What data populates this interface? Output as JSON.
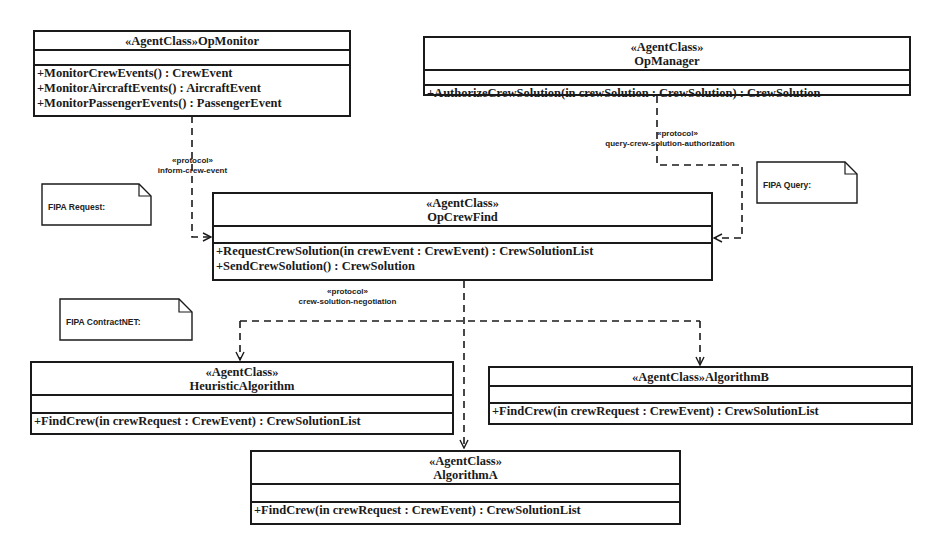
{
  "diagram": {
    "type": "UML agent class diagram",
    "classes": {
      "op_monitor": {
        "stereotype": "«AgentClass»",
        "name": "OpMonitor",
        "name_line": "«AgentClass»OpMonitor",
        "operations": [
          "+MonitorCrewEvents() : CrewEvent",
          "+MonitorAircraftEvents() : AircraftEvent",
          "+MonitorPassengerEvents() : PassengerEvent"
        ]
      },
      "op_manager": {
        "stereotype": "«AgentClass»",
        "name": "OpManager",
        "operations": [
          "+AuthorizeCrewSolution(in crewSolution : CrewSolution) : CrewSolution"
        ]
      },
      "op_crew_find": {
        "stereotype": "«AgentClass»",
        "name": "OpCrewFind",
        "operations": [
          "+RequestCrewSolution(in crewEvent : CrewEvent) : CrewSolutionList",
          "+SendCrewSolution() : CrewSolution"
        ]
      },
      "heuristic_algorithm": {
        "stereotype": "«AgentClass»",
        "name": "HeuristicAlgorithm",
        "operations": [
          "+FindCrew(in crewRequest : CrewEvent) : CrewSolutionList"
        ]
      },
      "algorithm_b": {
        "stereotype": "«AgentClass»",
        "name": "AlgorithmB",
        "name_line": "«AgentClass»AlgorithmB",
        "operations": [
          "+FindCrew(in crewRequest : CrewEvent) : CrewSolutionList"
        ]
      },
      "algorithm_a": {
        "stereotype": "«AgentClass»",
        "name": "AlgorithmA",
        "operations": [
          "+FindCrew(in crewRequest : CrewEvent) : CrewSolutionList"
        ]
      }
    },
    "protocols": {
      "inform": {
        "stereotype": "«protocol»",
        "name": "inform-crew-event"
      },
      "query": {
        "stereotype": "«protocol»",
        "name": "query-crew-solution-authorization"
      },
      "negotiation": {
        "stereotype": "«protocol»",
        "name": "crew-solution-negotiation"
      }
    },
    "notes": {
      "fipa_request": "FIPA Request:",
      "fipa_query": "FIPA Query:",
      "fipa_contractnet": "FIPA ContractNET:"
    },
    "colors": {
      "line": "#1a1a1a",
      "background": "#ffffff"
    }
  }
}
